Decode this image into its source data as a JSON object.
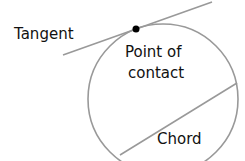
{
  "labels": {
    "tangent": "Tangent",
    "point_line1": "Point of",
    "point_line2": "contact",
    "chord": "Chord"
  },
  "colors": {
    "line": "#999999",
    "point": "#000000",
    "text": "#111111"
  }
}
